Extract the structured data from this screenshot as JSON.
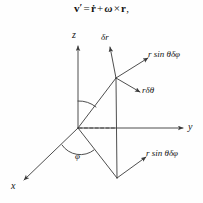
{
  "figure": {
    "background_color": "#fefefe",
    "line_color": "#3a3a3a",
    "text_color": "#141414",
    "equation": {
      "lhs_vector": "v",
      "lhs_prime": "′",
      "equals": "=",
      "term1": "ṙ",
      "plus": "+",
      "omega": "ω",
      "cross": "×",
      "term2": "r",
      "comma": ","
    }
  },
  "axes": [
    {
      "name": "z-axis",
      "label": "z"
    },
    {
      "name": "y-axis",
      "label": "y"
    },
    {
      "name": "x-axis",
      "label": "x"
    }
  ],
  "angles": [
    {
      "name": "theta-angle",
      "label": ""
    },
    {
      "name": "phi-angle",
      "label": "φ"
    }
  ],
  "vectors": [
    {
      "name": "delta-r-vector",
      "label": "δr"
    },
    {
      "name": "r-sin-theta-delta-phi-vector-upper",
      "label": "r sin θδφ"
    },
    {
      "name": "r-delta-theta-vector",
      "label": "rδθ"
    },
    {
      "name": "r-sin-theta-delta-phi-vector-lower",
      "label": "r sin θδφ"
    }
  ]
}
